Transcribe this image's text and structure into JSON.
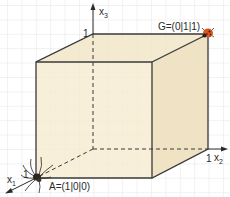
{
  "diagram": {
    "type": "3d-unit-cube-coordinate-system",
    "axes": {
      "x1": {
        "label": "x",
        "subscript": "1",
        "tick": "1"
      },
      "x2": {
        "label": "x",
        "subscript": "2",
        "tick": "1"
      },
      "x3": {
        "label": "x",
        "subscript": "3",
        "tick": "1"
      }
    },
    "points": {
      "A": {
        "label": "A=(1|0|0)",
        "creature": "spider"
      },
      "G": {
        "label": "G=(0|1|1)",
        "creature": "ladybug"
      }
    },
    "colors": {
      "cube_fill": "#f5ecd2",
      "cube_edge": "#3a3a3a",
      "grid": "#e2e2e2",
      "ladybug": "#d9541e",
      "spider": "#2a2520"
    }
  }
}
